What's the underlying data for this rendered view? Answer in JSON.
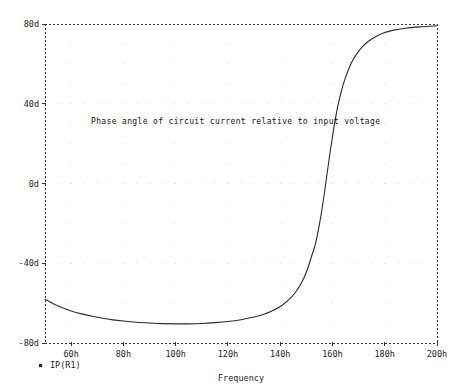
{
  "chart_data": {
    "type": "line",
    "title": "",
    "annotation": "Phase angle of circuit current relative to input voltage",
    "xlabel": "Frequency",
    "ylabel": "",
    "xlim": [
      50,
      200
    ],
    "ylim": [
      -80,
      80
    ],
    "x_tick_labels": [
      "60h",
      "80h",
      "100h",
      "120h",
      "140h",
      "160h",
      "180h",
      "200h"
    ],
    "x_tick_values": [
      60,
      80,
      100,
      120,
      140,
      160,
      180,
      200
    ],
    "y_tick_labels": [
      "80d",
      "40d",
      "0d",
      "-40d",
      "-80d"
    ],
    "y_tick_values": [
      80,
      40,
      0,
      -40,
      -80
    ],
    "grid": true,
    "legend_position": "below-left",
    "series": [
      {
        "name": "IP(R1)",
        "marker": "square",
        "color": "#2b2b2b",
        "x": [
          50,
          53,
          56,
          60,
          64,
          68,
          72,
          76,
          80,
          85,
          90,
          95,
          100,
          105,
          110,
          115,
          120,
          125,
          130,
          134,
          138,
          141,
          144,
          146,
          148,
          150,
          152,
          153.5,
          155,
          156,
          157,
          158,
          159,
          160,
          161,
          162,
          163.5,
          165,
          167,
          169,
          172,
          175,
          179,
          183,
          188,
          194,
          200
        ],
        "y": [
          -58.0,
          -60.2,
          -62.0,
          -63.9,
          -65.4,
          -66.6,
          -67.6,
          -68.4,
          -69.0,
          -69.6,
          -70.0,
          -70.3,
          -70.4,
          -70.4,
          -70.2,
          -69.8,
          -69.2,
          -68.3,
          -67.0,
          -65.5,
          -63.2,
          -60.8,
          -57.4,
          -54.3,
          -50.2,
          -44.5,
          -36.5,
          -30.2,
          -20.5,
          -12.8,
          -4.0,
          5.5,
          14.8,
          23.5,
          31.5,
          38.5,
          46.8,
          53.2,
          59.8,
          64.5,
          69.4,
          72.5,
          75.2,
          76.8,
          77.9,
          78.6,
          79.1
        ]
      }
    ]
  },
  "axes_geometry": {
    "plot_left": 45,
    "plot_right": 437,
    "plot_top": 24,
    "plot_bottom": 343
  }
}
